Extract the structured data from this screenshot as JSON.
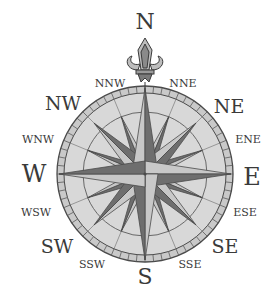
{
  "compass": {
    "center": {
      "x": 145,
      "y": 174
    },
    "outer_radius": 88,
    "inner_ring_radius": 80,
    "mid_ring_radius": 62,
    "colors": {
      "face": "#d6d6d6",
      "ring": "#c4c4c4",
      "stroke": "#4a4a4a",
      "star_light": "#c8c8c8",
      "star_dark": "#6e6e6e",
      "star_mid": "#9a9a9a",
      "label": "#3a3a3a"
    },
    "labels": {
      "N": "N",
      "NNE": "NNE",
      "NE": "NE",
      "ENE": "ENE",
      "E": "E",
      "ESE": "ESE",
      "SE": "SE",
      "SSE": "SSE",
      "S": "S",
      "SSW": "SSW",
      "SW": "SW",
      "WSW": "WSW",
      "W": "W",
      "WNW": "WNW",
      "NW": "NW",
      "NNW": "NNW"
    },
    "ornament": "fleur-de-lis"
  }
}
